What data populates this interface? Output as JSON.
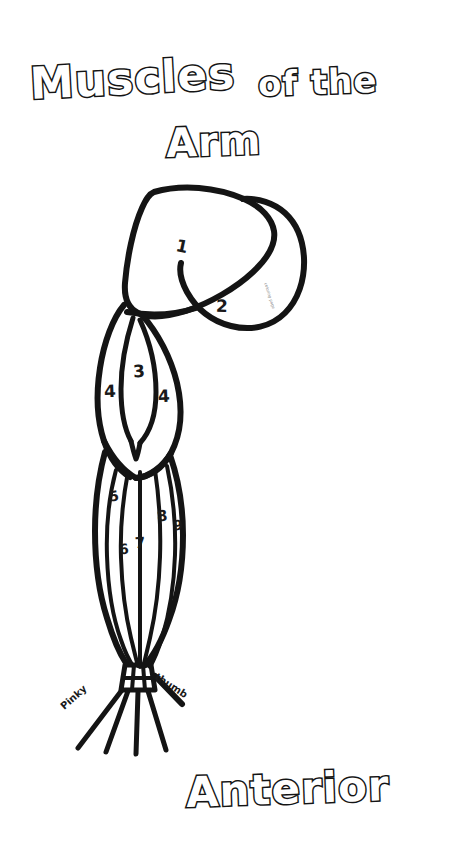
{
  "page": {
    "background_color": "#ffffff",
    "ink_color": "#141414",
    "document_type": "anatomy coloring worksheet"
  },
  "title": {
    "line1_part1": "Muscles",
    "line1_part2": "of the",
    "line2": "Arm"
  },
  "footer": {
    "view_label": "Anterior"
  },
  "diagram": {
    "name": "arm-muscle-outline",
    "numbered_regions": [
      {
        "id": "region-1",
        "number": "1",
        "x": 176,
        "y": 236,
        "region": "deltoid"
      },
      {
        "id": "region-2",
        "number": "2",
        "x": 216,
        "y": 296,
        "region": "pectoralis"
      },
      {
        "id": "region-3",
        "number": "3",
        "x": 133,
        "y": 367,
        "region": "biceps-brachii"
      },
      {
        "id": "region-4a",
        "number": "4",
        "x": 106,
        "y": 388,
        "region": "brachialis-lateral"
      },
      {
        "id": "region-4b",
        "number": "4",
        "x": 159,
        "y": 393,
        "region": "brachialis-medial"
      },
      {
        "id": "region-5",
        "number": "5",
        "x": 110,
        "y": 495,
        "region": "brachioradialis"
      },
      {
        "id": "region-6",
        "number": "6",
        "x": 120,
        "y": 548,
        "region": "flexor-carpi-radialis"
      },
      {
        "id": "region-7",
        "number": "7",
        "x": 137,
        "y": 542,
        "region": "palmaris-longus"
      },
      {
        "id": "region-8",
        "number": "8",
        "x": 159,
        "y": 515,
        "region": "flexor-carpi-ulnaris"
      },
      {
        "id": "region-9",
        "number": "9",
        "x": 175,
        "y": 524,
        "region": "flexor-digitorum"
      }
    ],
    "hand_labels": [
      {
        "id": "pinky-label",
        "text": "Pinky",
        "x": 63,
        "y": 700,
        "rotation": -42
      },
      {
        "id": "thumb-label",
        "text": "thumb",
        "x": 157,
        "y": 672,
        "rotation": 33
      }
    ],
    "watermark": {
      "text": "coloring page",
      "x": 268,
      "y": 284
    }
  }
}
